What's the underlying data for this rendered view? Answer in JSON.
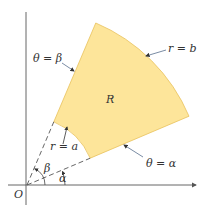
{
  "diagram": {
    "region_label": "R",
    "origin_label": "O",
    "alpha_label": "α",
    "beta_label": "β",
    "annotations": {
      "theta_beta": "θ = β",
      "theta_alpha": "θ = α",
      "r_a": "r = a",
      "r_b": "r = b"
    },
    "parameters": {
      "alpha_deg": 23,
      "beta_deg": 67,
      "a_over_b": 0.39
    },
    "colors": {
      "region_fill": "#fde59a",
      "region_stroke": "#e9c15c",
      "axis": "#555555",
      "dashed": "#555555",
      "leader": "#6b7f9a"
    }
  }
}
